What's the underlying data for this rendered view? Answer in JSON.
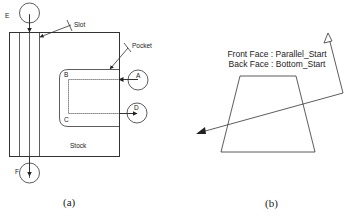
{
  "panel_a": {
    "caption": "(a)",
    "labels": {
      "slot": "Slot",
      "pocket": "Pocket",
      "stock": "Stock",
      "A": "A",
      "B": "B",
      "C": "C",
      "D": "D",
      "E": "E",
      "F": "F"
    }
  },
  "panel_b": {
    "caption": "(b)",
    "front_face": "Front Face : Parallel_Start",
    "back_face": "Back Face : Bottom_Start"
  },
  "colors": {
    "line": "#333333",
    "text": "#222222",
    "background": "#ffffff"
  }
}
